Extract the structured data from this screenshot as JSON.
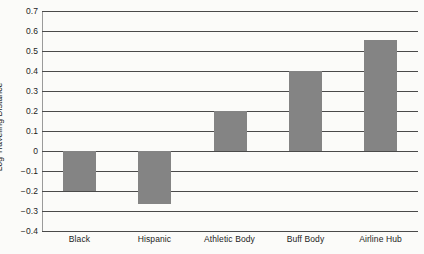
{
  "chart_data": {
    "type": "bar",
    "title": "",
    "subtitle": "",
    "xlabel": "",
    "ylabel": "Log Traveling Distance",
    "categories": [
      "Black",
      "Hispanic",
      "Athletic Body",
      "Buff Body",
      "Airline Hub"
    ],
    "values": [
      -0.2,
      -0.265,
      0.2,
      0.4,
      0.555
    ],
    "ylim": [
      -0.4,
      0.7
    ],
    "ytick_labels": [
      "0.7",
      "0.6",
      "0.5",
      "0.4",
      "0.3",
      "0.2",
      "0.1",
      "0",
      "−0.1",
      "−0.2",
      "−0.3",
      "−0.4"
    ],
    "ytick_values": [
      0.7,
      0.6,
      0.5,
      0.4,
      0.3,
      0.2,
      0.1,
      0,
      -0.1,
      -0.2,
      -0.3,
      -0.4
    ],
    "grid": true,
    "legend": "none",
    "bar_color": "#848484",
    "gridline_color": "#4a4a4a",
    "background_color": "#fbfbf9",
    "text_color": "#1d1d1d"
  }
}
